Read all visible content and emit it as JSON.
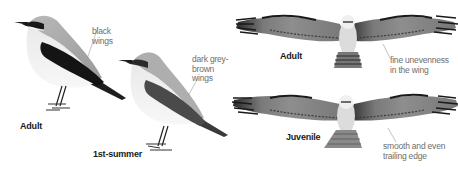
{
  "panels": {
    "wheatear": {
      "adult": {
        "label": "Adult",
        "annotation": "black\nwings"
      },
      "first_summer": {
        "label": "1st-summer",
        "annotation": "dark grey-\nbrown\nwings"
      }
    },
    "osprey": {
      "adult": {
        "label": "Adult",
        "annotation": "fine unevenness\nin the wing"
      },
      "juvenile": {
        "label": "Juvenile",
        "annotation": "smooth and even\ntrailing edge"
      }
    }
  },
  "colors": {
    "background": "#ffffff",
    "label_text": "#1a1a1a",
    "annotation_text": "#6e6e6e",
    "leader_line": "#9a9a9a"
  }
}
